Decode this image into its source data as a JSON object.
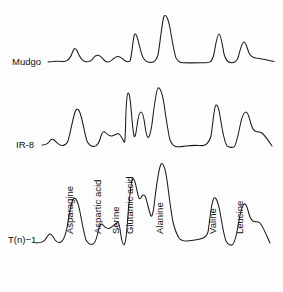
{
  "figure": {
    "background_color": "#fdfdfd",
    "line_color": "#1a1a1a",
    "text_color": "#111111"
  },
  "chart_data": {
    "type": "line",
    "title": "",
    "subtitle": "",
    "xlabel": "",
    "ylabel": "",
    "grid": false,
    "legend_position": "inline-left",
    "xlim": [
      0,
      283
    ],
    "ylim": [
      0,
      292
    ],
    "annotations": [
      {
        "text": "Asparagine",
        "x": 73,
        "orientation": "vertical"
      },
      {
        "text": "Aspartic acid",
        "x": 101,
        "orientation": "vertical"
      },
      {
        "text": "Serine",
        "x": 119,
        "orientation": "vertical"
      },
      {
        "text": "Glutamic acid",
        "x": 133,
        "orientation": "vertical"
      },
      {
        "text": "Alanine",
        "x": 163,
        "orientation": "vertical"
      },
      {
        "text": "Valine",
        "x": 216,
        "orientation": "vertical"
      },
      {
        "text": "Leucine",
        "x": 243,
        "orientation": "vertical"
      }
    ],
    "series": [
      {
        "name": "Mudgo",
        "label": "Mudgo",
        "baseline": 62,
        "peaks": [
          {
            "analyte": "Asparagine",
            "x": 75,
            "height": 14
          },
          {
            "analyte": "Aspartic acid",
            "x": 101,
            "height": 6
          },
          {
            "analyte": "Serine",
            "x": 117,
            "height": 5
          },
          {
            "analyte": "Glutamic acid",
            "x": 133,
            "height": 26
          },
          {
            "analyte": "Alanine",
            "x": 163,
            "height": 46
          },
          {
            "analyte": "Valine",
            "x": 217,
            "height": 28
          },
          {
            "analyte": "Leucine",
            "x": 245,
            "height": 20
          }
        ]
      },
      {
        "name": "IR-8",
        "label": "IR-8",
        "baseline": 145,
        "peaks": [
          {
            "analyte": "Asparagine",
            "x": 76,
            "height": 35
          },
          {
            "analyte": "Aspartic acid",
            "x": 101,
            "height": 13
          },
          {
            "analyte": "Serine",
            "x": 117,
            "height": 12
          },
          {
            "analyte": "Glutamic acid",
            "x": 125,
            "height": 53
          },
          {
            "analyte": "Glutamic acid shoulder",
            "x": 140,
            "height": 33
          },
          {
            "analyte": "Alanine",
            "x": 158,
            "height": 57
          },
          {
            "analyte": "Valine",
            "x": 215,
            "height": 40
          },
          {
            "analyte": "Leucine",
            "x": 243,
            "height": 33
          }
        ]
      },
      {
        "name": "T(n)-1",
        "label": "T(n)−1",
        "baseline": 243,
        "peaks": [
          {
            "analyte": "Asparagine",
            "x": 74,
            "height": 45
          },
          {
            "analyte": "Aspartic acid",
            "x": 100,
            "height": 20
          },
          {
            "analyte": "Serine",
            "x": 118,
            "height": 21
          },
          {
            "analyte": "Glutamic acid",
            "x": 133,
            "height": 64
          },
          {
            "analyte": "Glutamic acid shoulder",
            "x": 145,
            "height": 48
          },
          {
            "analyte": "Alanine",
            "x": 163,
            "height": 79
          },
          {
            "analyte": "Valine",
            "x": 216,
            "height": 46
          },
          {
            "analyte": "Leucine",
            "x": 243,
            "height": 42
          }
        ]
      }
    ]
  },
  "traces": {
    "mudgo": {
      "label": "Mudgo",
      "label_x": 12,
      "label_y": 65,
      "path": "M 48,62 L 53,61.5 C 57,61 60,61.3 64,61.5 C 68,61.6 71,57 73,51 C 75,46 77,50 79,55 C 81,59 83,61.5 86,61.8 C 89,62 91,61.5 93,58.5 C 95,55.5 97,55 99,55.5 C 101,56 103,59 105,61 C 107,62.3 110,62 112,60 C 114,58 116,56.5 118,56.5 C 120,56.5 122,58 124,60 C 126,61.8 128,62.2 130,61 C 131.5,58 132.5,44 134,36 C 135,32 136.5,34 138,40 C 139.5,46 141,53 143,57.5 C 145,61 147,62.3 150,62.4 C 153,62.4 156,62 158,55 C 160,44 162,22 164,16 C 166,14 168,18 170,28 C 172,40 174,52 176,58 C 178,61.5 180,62.6 183,62.8 C 190,63 198,62.8 206,62.7 C 210,62.6 212,62 214,54 C 215.5,46 217,34 219,34 C 221,34 222.5,46 224,54 C 226,61 228,62.6 231,62.8 C 234,63 236,62.5 238,58 C 240,50 242,42 244,42 C 246,42 247,48 249,53 C 251,57 253,57.5 256,58 C 262,58.8 268,60 274,61.5"
    },
    "ir8": {
      "label": "IR-8",
      "label_x": 16,
      "label_y": 148,
      "path": "M 42,145 C 45,144.8 47,144.8 49,142 C 50.5,139.5 52,138.5 54,140 C 56,141.5 57.5,144 60,145 C 63,146 66,145.5 68,141 C 70,135 72,122 75,112 C 77,107 79,109 81,116 C 83,123 85,135 87,141 C 89,145.5 91,146.5 94,146.5 C 97,146.5 99,144 101,136 C 102.5,131 104,131 106,133 C 108,135 109.5,136.5 112,136 C 114,135.5 116,134 118,133.5 C 120,133.5 122,138 124,142 C 124.8,143 125.2,140 125.6,124 C 126,108 127,94 128,93 C 129,92.5 130,96 131,108 C 132,120 133,132 134,136 C 135,138 136,134 137,126 C 138,118 139.5,112 141,112 C 142.5,112 144,118 145,126 C 146,133 147,137 148,137.5 C 149,138 150.5,134 152,124 C 154,108 156,90 158,88 C 160,87 162,92 164,104 C 166,118 168,132 170,140 C 172,145 174,146.5 177,146.8 C 180,147 183,146.5 186,146 C 190,145.5 194,145.2 198,145.5 C 201,145.6 203,146 205,145 C 207,144 209,143 211,136 C 212.5,128 214,106 216,105 C 218,104 219.5,112 221,122 C 223,134 225,143 227,145.8 C 229,147.5 231,147.8 234,147 C 236,145 238,136 240,126 C 242,116 244,112 246,112 C 248,112 249.5,118 251,124 C 252.5,129 254,131 256,131.5 C 258,132 260,131.5 262,133 C 265,135.5 268,140 272,146"
    },
    "tn1": {
      "label": "T(n)−1",
      "label_x": 8,
      "label_y": 243,
      "path": "M 36,243 C 40,242.8 43,242.5 45,240 C 47,237 48.5,234 50,234 C 52,234 53.5,237.5 55,240 C 57,242.5 59,243 61,242 C 63,241 65,237 67,228 C 69,216 71,200 74,198 C 76,197.5 78,202 80,212 C 82,222 84,234 86,240 C 88,243.5 90,244.5 92,244.5 C 94,244.5 96,242 98,232 C 99.5,224 101,223 103,225 C 105,227 106.5,229 109,228.5 C 111,228 113,226 115,224.5 C 116.5,223.5 117.5,222 118,222 C 119,222 120,228 121,236 C 122,242 123,245 124,245 C 125,244 126,240 127,228 C 128,214 130,190 132,180 C 133,177 134.5,179 136,186 C 137,191 138,196 139,198 C 140,200 141,198 142,196 C 143,194.5 144,195 145,196 C 146,197.5 147,202 148,206 C 149,210 150,214 151,216 C 152,217 153,214 154,206 C 156,190 158,170 161,164 C 163,162 165,167 167,180 C 169,195 171,212 173,222 C 175,230 177,235 179,238 C 181,240.5 183,241 186,241 C 189,241 192,240.5 195,240 C 198,239.5 201,239 203,238 C 205,237 207,236.5 208,232 C 209.5,224 211,202 214,198 C 216,196.5 218,202 220,212 C 222,224 224,236 226,241 C 228,244.5 230,245.5 232,245 C 234,244 236,238 238,226 C 240,214 242,206 244,204 C 246,203 247.5,208 249,214 C 250.5,219 252,221 254,221.5 C 256,222 258,221 260,223 C 263,226.5 266,234 270,243"
    }
  }
}
